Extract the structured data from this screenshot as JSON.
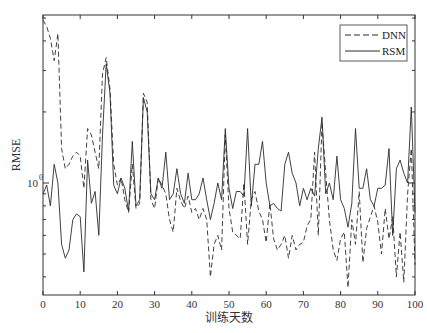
{
  "chart_data": {
    "type": "line",
    "title": "",
    "xlabel": "训练天数",
    "ylabel": "RMSE",
    "yscale": "log",
    "xlim": [
      0,
      100
    ],
    "ylim": [
      0.335,
      5.1
    ],
    "xticks": [
      0,
      10,
      20,
      30,
      40,
      50,
      60,
      70,
      80,
      90,
      100
    ],
    "yticks_labeled": [
      {
        "value": 1,
        "label": "10^0"
      }
    ],
    "yticks_minor": [
      0.4,
      0.5,
      0.6,
      0.7,
      0.8,
      0.9,
      2,
      3,
      4,
      5
    ],
    "grid": false,
    "legend": {
      "position": "upper right",
      "entries": [
        "DNN",
        "RSM"
      ]
    },
    "x": [
      0,
      1,
      2,
      3,
      4,
      5,
      6,
      7,
      8,
      9,
      10,
      11,
      12,
      13,
      14,
      15,
      16,
      17,
      18,
      19,
      20,
      21,
      22,
      23,
      24,
      25,
      26,
      27,
      28,
      29,
      30,
      31,
      32,
      33,
      34,
      35,
      36,
      37,
      38,
      39,
      40,
      41,
      42,
      43,
      44,
      45,
      46,
      47,
      48,
      49,
      50,
      51,
      52,
      53,
      54,
      55,
      56,
      57,
      58,
      59,
      60,
      61,
      62,
      63,
      64,
      65,
      66,
      67,
      68,
      69,
      70,
      71,
      72,
      73,
      74,
      75,
      76,
      77,
      78,
      79,
      80,
      81,
      82,
      83,
      84,
      85,
      86,
      87,
      88,
      89,
      90,
      91,
      92,
      93,
      94,
      95,
      96,
      97,
      98,
      99,
      100
    ],
    "series": [
      {
        "name": "DNN",
        "style": "dashed",
        "values": [
          4.9,
          4.6,
          4.1,
          3.3,
          4.3,
          1.4,
          1.15,
          1.2,
          1.3,
          1.35,
          1.3,
          0.95,
          1.7,
          1.6,
          1.35,
          1.15,
          2.9,
          3.4,
          2.5,
          1.2,
          0.98,
          1.05,
          0.85,
          0.75,
          1.2,
          0.78,
          0.82,
          2.4,
          2.2,
          0.85,
          0.78,
          1.05,
          0.98,
          0.9,
          0.7,
          0.62,
          0.95,
          0.84,
          0.78,
          0.88,
          0.75,
          0.78,
          0.7,
          0.78,
          0.7,
          0.4,
          0.55,
          0.6,
          0.52,
          1.6,
          0.78,
          0.62,
          0.6,
          0.58,
          1.0,
          0.55,
          0.85,
          0.92,
          0.76,
          0.7,
          0.56,
          0.82,
          0.58,
          0.52,
          0.55,
          0.6,
          0.48,
          0.6,
          0.52,
          0.55,
          0.56,
          0.66,
          0.7,
          1.35,
          0.6,
          1.8,
          1.1,
          0.7,
          0.52,
          0.47,
          0.58,
          0.62,
          0.36,
          0.7,
          0.55,
          0.92,
          0.46,
          0.64,
          0.72,
          0.8,
          0.68,
          0.5,
          0.78,
          0.58,
          0.72,
          0.4,
          0.62,
          0.38,
          0.9,
          1.4,
          0.45
        ]
      },
      {
        "name": "RSM",
        "style": "solid",
        "values": [
          0.9,
          0.98,
          0.8,
          1.2,
          1.0,
          0.55,
          0.48,
          0.52,
          0.7,
          0.74,
          0.72,
          0.42,
          1.25,
          0.82,
          0.92,
          0.6,
          1.6,
          3.2,
          2.4,
          0.98,
          0.9,
          1.05,
          0.95,
          0.76,
          1.5,
          0.8,
          0.85,
          2.3,
          2.0,
          0.9,
          0.85,
          1.05,
          0.95,
          1.35,
          0.85,
          0.9,
          1.15,
          0.9,
          0.82,
          1.1,
          0.85,
          0.85,
          0.9,
          1.05,
          0.85,
          0.7,
          0.82,
          1.0,
          0.85,
          1.7,
          0.95,
          0.78,
          0.92,
          0.92,
          0.88,
          1.7,
          0.8,
          1.2,
          1.2,
          1.5,
          1.0,
          0.8,
          0.82,
          0.78,
          0.76,
          1.2,
          1.35,
          1.1,
          1.0,
          0.8,
          0.95,
          0.85,
          0.95,
          0.88,
          1.4,
          1.9,
          0.9,
          1.0,
          0.85,
          1.3,
          0.85,
          0.78,
          0.65,
          0.82,
          1.7,
          0.95,
          0.95,
          1.15,
          0.85,
          0.8,
          0.95,
          0.95,
          0.98,
          1.4,
          0.6,
          1.15,
          1.25,
          1.1,
          1.0,
          2.1,
          0.75
        ]
      }
    ]
  },
  "axes": {
    "x_title": "训练天数",
    "y_title": "RMSE",
    "y_major_label_base": "10",
    "y_major_label_exp": "0"
  },
  "legend": {
    "items": [
      {
        "label": "DNN",
        "style": "dashed"
      },
      {
        "label": "RSM",
        "style": "solid"
      }
    ]
  },
  "colors": {
    "line": "#2b2b2b",
    "axis": "#333333",
    "background": "#ffffff"
  }
}
